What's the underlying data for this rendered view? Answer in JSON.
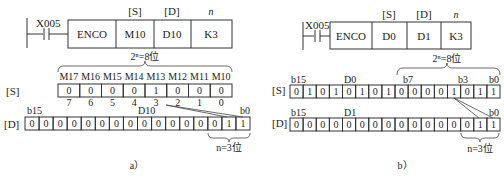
{
  "panels": [
    {
      "caption": "a）",
      "ladder": {
        "contact": "X005",
        "headers": [
          "[S]",
          "[D]",
          "n"
        ],
        "cells": [
          "ENCO",
          "M10",
          "D10",
          "K3"
        ]
      },
      "brace_top_label": "2ⁿ=8位",
      "source": {
        "row_label": "[S]",
        "column_names": [
          "M17",
          "M16",
          "M15",
          "M14",
          "M13",
          "M12",
          "M11",
          "M10"
        ],
        "bits": [
          "0",
          "0",
          "0",
          "0",
          "1",
          "0",
          "0",
          "0"
        ],
        "indices": [
          "7",
          "6",
          "5",
          "4",
          "3",
          "2",
          "1",
          "0"
        ]
      },
      "dest": {
        "row_label": "[D]",
        "left_bit_label": "b15",
        "register_label": "D10",
        "right_bit_label": "b0",
        "bits": [
          "0",
          "0",
          "0",
          "0",
          "0",
          "0",
          "0",
          "0",
          "0",
          "0",
          "0",
          "0",
          "0",
          "0",
          "1",
          "1"
        ]
      },
      "brace_bottom_label": "n=3位"
    },
    {
      "caption": "b）",
      "ladder": {
        "contact": "X005",
        "headers": [
          "[S]",
          "[D]",
          "n"
        ],
        "cells": [
          "ENCO",
          "D0",
          "D1",
          "K3"
        ]
      },
      "brace_top_label": "2ⁿ=8位",
      "source": {
        "row_label": "[S]",
        "left_bit_label": "b15",
        "register_label": "D0",
        "mid_bit_labels": [
          "b7",
          "b3"
        ],
        "right_bit_label": "b0",
        "bits": [
          "0",
          "1",
          "0",
          "1",
          "0",
          "1",
          "0",
          "1",
          "0",
          "0",
          "0",
          "0",
          "1",
          "0",
          "1",
          "1"
        ]
      },
      "dest": {
        "row_label": "[D]",
        "left_bit_label": "b15",
        "register_label": "D1",
        "right_bit_label": "b0",
        "bits": [
          "0",
          "0",
          "0",
          "0",
          "0",
          "0",
          "0",
          "0",
          "0",
          "0",
          "0",
          "0",
          "0",
          "0",
          "1",
          "1"
        ]
      },
      "brace_bottom_label": "n=3位"
    }
  ]
}
